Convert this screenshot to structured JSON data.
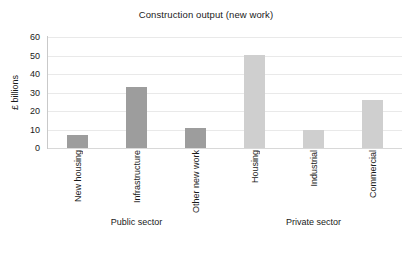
{
  "chart_data": {
    "type": "bar",
    "title": "Construction output (new work)",
    "xlabel": "",
    "ylabel": "£ billions",
    "ylim": [
      0,
      60
    ],
    "ytick_labels": [
      "60",
      "50",
      "40",
      "30",
      "20",
      "10",
      "0"
    ],
    "ytick_values": [
      60,
      50,
      40,
      30,
      20,
      10,
      0
    ],
    "grid": true,
    "legend": "none",
    "categories": [
      "New housing",
      "Infrastructure",
      "Other new work",
      "Housing",
      "Industrial",
      "Commercial"
    ],
    "values": [
      7,
      33,
      11,
      50.5,
      9.5,
      26
    ],
    "bar_colors": [
      "#9d9d9d",
      "#9d9d9d",
      "#9d9d9d",
      "#cfcfcf",
      "#cfcfcf",
      "#cfcfcf"
    ],
    "groups": [
      {
        "label": "Public sector",
        "categories": [
          "New housing",
          "Infrastructure",
          "Other new work"
        ]
      },
      {
        "label": "Private sector",
        "categories": [
          "Housing",
          "Industrial",
          "Commercial"
        ]
      }
    ],
    "series": [
      {
        "name": "Construction output",
        "values": [
          7,
          33,
          11,
          50.5,
          9.5,
          26
        ]
      }
    ]
  },
  "colors": {
    "public_bar": "#9d9d9d",
    "private_bar": "#cfcfcf",
    "gridline": "#e9e9e9",
    "text": "#1a1a1a",
    "background": "#ffffff"
  },
  "group_labels": {
    "public": "Public sector",
    "private": "Private sector"
  }
}
